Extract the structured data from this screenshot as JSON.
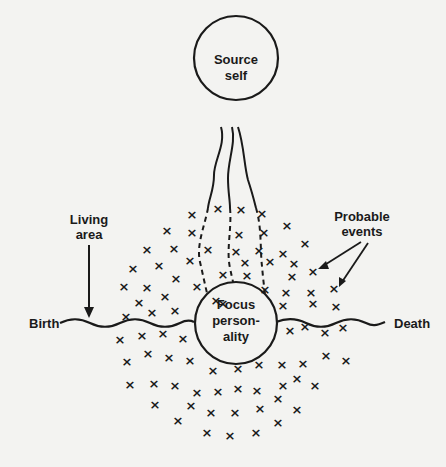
{
  "diagram": {
    "source_circle": {
      "line1": "Source",
      "line2": "self"
    },
    "focus_circle": {
      "line1": "Focus",
      "line2": "person-",
      "line3": "ality"
    },
    "labels": {
      "living_area_line1": "Living",
      "living_area_line2": "area",
      "probable_events_line1": "Probable",
      "probable_events_line2": "events",
      "birth": "Birth",
      "death": "Death"
    },
    "event_marker_glyph": "×",
    "colors": {
      "ink": "#1a1a1a",
      "paper": "#f3f3f1"
    },
    "event_markers": [
      [
        192,
        214
      ],
      [
        218,
        208
      ],
      [
        241,
        209
      ],
      [
        262,
        213
      ],
      [
        167,
        230
      ],
      [
        192,
        232
      ],
      [
        239,
        234
      ],
      [
        264,
        232
      ],
      [
        287,
        225
      ],
      [
        147,
        249
      ],
      [
        174,
        248
      ],
      [
        208,
        249
      ],
      [
        236,
        251
      ],
      [
        259,
        250
      ],
      [
        283,
        253
      ],
      [
        305,
        243
      ],
      [
        133,
        268
      ],
      [
        159,
        265
      ],
      [
        190,
        260
      ],
      [
        245,
        262
      ],
      [
        270,
        261
      ],
      [
        294,
        263
      ],
      [
        313,
        271
      ],
      [
        124,
        286
      ],
      [
        147,
        287
      ],
      [
        176,
        278
      ],
      [
        223,
        274
      ],
      [
        247,
        275
      ],
      [
        292,
        276
      ],
      [
        334,
        288
      ],
      [
        139,
        302
      ],
      [
        165,
        296
      ],
      [
        197,
        286
      ],
      [
        223,
        303
      ],
      [
        265,
        289
      ],
      [
        286,
        292
      ],
      [
        311,
        292
      ],
      [
        126,
        316
      ],
      [
        152,
        312
      ],
      [
        175,
        310
      ],
      [
        216,
        300
      ],
      [
        283,
        305
      ],
      [
        313,
        303
      ],
      [
        336,
        306
      ],
      [
        120,
        339
      ],
      [
        142,
        335
      ],
      [
        163,
        333
      ],
      [
        183,
        338
      ],
      [
        290,
        330
      ],
      [
        305,
        326
      ],
      [
        325,
        332
      ],
      [
        343,
        327
      ],
      [
        148,
        353
      ],
      [
        169,
        357
      ],
      [
        190,
        360
      ],
      [
        127,
        361
      ],
      [
        213,
        370
      ],
      [
        238,
        368
      ],
      [
        259,
        364
      ],
      [
        282,
        364
      ],
      [
        303,
        363
      ],
      [
        326,
        355
      ],
      [
        346,
        360
      ],
      [
        130,
        384
      ],
      [
        154,
        383
      ],
      [
        175,
        385
      ],
      [
        197,
        392
      ],
      [
        218,
        391
      ],
      [
        238,
        388
      ],
      [
        257,
        390
      ],
      [
        283,
        385
      ],
      [
        297,
        378
      ],
      [
        315,
        385
      ],
      [
        155,
        404
      ],
      [
        191,
        405
      ],
      [
        211,
        412
      ],
      [
        235,
        412
      ],
      [
        260,
        408
      ],
      [
        278,
        398
      ],
      [
        297,
        409
      ],
      [
        178,
        420
      ],
      [
        278,
        422
      ],
      [
        207,
        432
      ],
      [
        230,
        435
      ],
      [
        256,
        432
      ]
    ]
  }
}
